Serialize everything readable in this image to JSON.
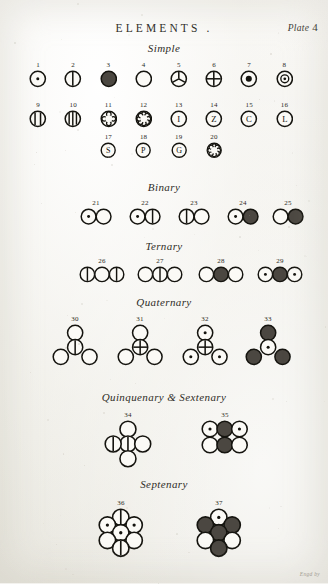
{
  "header": {
    "title": "ELEMENTS .",
    "plate_label": "Plate",
    "plate_number": "4"
  },
  "sections": [
    {
      "name": "simple",
      "heading": "Simple"
    },
    {
      "name": "binary",
      "heading": "Binary"
    },
    {
      "name": "ternary",
      "heading": "Ternary"
    },
    {
      "name": "quaternary",
      "heading": "Quaternary"
    },
    {
      "name": "quinquenary",
      "heading": "Quinquenary & Sextenary"
    },
    {
      "name": "septenary",
      "heading": "Septenary"
    }
  ],
  "signature": "Engd by",
  "colors": {
    "ink": "#15140f",
    "paper": "#f3f2ee",
    "fill_dark": "#4b4741",
    "fill_white": "#fbfaf6"
  },
  "figures": [
    {
      "n": "1",
      "section": "simple",
      "atoms": [
        {
          "glyph": "dot"
        }
      ]
    },
    {
      "n": "2",
      "section": "simple",
      "atoms": [
        {
          "glyph": "vline1"
        }
      ]
    },
    {
      "n": "3",
      "section": "simple",
      "atoms": [
        {
          "glyph": "solid"
        }
      ]
    },
    {
      "n": "4",
      "section": "simple",
      "atoms": [
        {
          "glyph": "empty"
        }
      ]
    },
    {
      "n": "5",
      "section": "simple",
      "atoms": [
        {
          "glyph": "ypart"
        }
      ]
    },
    {
      "n": "6",
      "section": "simple",
      "atoms": [
        {
          "glyph": "cross"
        }
      ]
    },
    {
      "n": "7",
      "section": "simple",
      "atoms": [
        {
          "glyph": "bigdot"
        }
      ]
    },
    {
      "n": "8",
      "section": "simple",
      "atoms": [
        {
          "glyph": "ring"
        }
      ]
    },
    {
      "n": "9",
      "section": "simple",
      "atoms": [
        {
          "glyph": "vline2"
        }
      ]
    },
    {
      "n": "10",
      "section": "simple",
      "atoms": [
        {
          "glyph": "vline3"
        }
      ]
    },
    {
      "n": "11",
      "section": "simple",
      "atoms": [
        {
          "glyph": "petal4"
        }
      ]
    },
    {
      "n": "12",
      "section": "simple",
      "atoms": [
        {
          "glyph": "petal8"
        }
      ]
    },
    {
      "n": "13",
      "section": "simple",
      "atoms": [
        {
          "glyph": "letter",
          "letter": "I"
        }
      ]
    },
    {
      "n": "14",
      "section": "simple",
      "atoms": [
        {
          "glyph": "letter",
          "letter": "Z"
        }
      ]
    },
    {
      "n": "15",
      "section": "simple",
      "atoms": [
        {
          "glyph": "letter",
          "letter": "C"
        }
      ]
    },
    {
      "n": "16",
      "section": "simple",
      "atoms": [
        {
          "glyph": "letter",
          "letter": "L"
        }
      ]
    },
    {
      "n": "17",
      "section": "simple",
      "atoms": [
        {
          "glyph": "letter",
          "letter": "S"
        }
      ]
    },
    {
      "n": "18",
      "section": "simple",
      "atoms": [
        {
          "glyph": "letter",
          "letter": "P"
        }
      ]
    },
    {
      "n": "19",
      "section": "simple",
      "atoms": [
        {
          "glyph": "letter",
          "letter": "G"
        }
      ]
    },
    {
      "n": "20",
      "section": "simple",
      "atoms": [
        {
          "glyph": "petal8b"
        }
      ]
    },
    {
      "n": "21",
      "section": "binary",
      "atoms": [
        {
          "glyph": "dot"
        },
        {
          "glyph": "empty"
        }
      ]
    },
    {
      "n": "22",
      "section": "binary",
      "atoms": [
        {
          "glyph": "dot"
        },
        {
          "glyph": "vline1"
        }
      ]
    },
    {
      "n": "23",
      "section": "binary",
      "atoms": [
        {
          "glyph": "vline1"
        },
        {
          "glyph": "empty"
        }
      ]
    },
    {
      "n": "24",
      "section": "binary",
      "atoms": [
        {
          "glyph": "dot"
        },
        {
          "glyph": "solid"
        }
      ]
    },
    {
      "n": "25",
      "section": "binary",
      "atoms": [
        {
          "glyph": "empty"
        },
        {
          "glyph": "solid"
        }
      ]
    },
    {
      "n": "26",
      "section": "ternary",
      "atoms": [
        {
          "glyph": "vline1"
        },
        {
          "glyph": "empty"
        },
        {
          "glyph": "vline1"
        }
      ]
    },
    {
      "n": "27",
      "section": "ternary",
      "atoms": [
        {
          "glyph": "empty"
        },
        {
          "glyph": "vline1"
        },
        {
          "glyph": "empty"
        }
      ]
    },
    {
      "n": "28",
      "section": "ternary",
      "atoms": [
        {
          "glyph": "empty"
        },
        {
          "glyph": "solid"
        },
        {
          "glyph": "empty"
        }
      ]
    },
    {
      "n": "29",
      "section": "ternary",
      "atoms": [
        {
          "glyph": "dot"
        },
        {
          "glyph": "solid"
        },
        {
          "glyph": "dot"
        }
      ]
    },
    {
      "n": "30",
      "section": "quaternary",
      "layout": "tri4",
      "atoms": [
        {
          "glyph": "empty"
        },
        {
          "glyph": "vline1"
        },
        {
          "glyph": "empty"
        },
        {
          "glyph": "empty"
        }
      ]
    },
    {
      "n": "31",
      "section": "quaternary",
      "layout": "tri4",
      "atoms": [
        {
          "glyph": "empty"
        },
        {
          "glyph": "cross"
        },
        {
          "glyph": "empty"
        },
        {
          "glyph": "empty"
        }
      ]
    },
    {
      "n": "32",
      "section": "quaternary",
      "layout": "tri4",
      "atoms": [
        {
          "glyph": "dot"
        },
        {
          "glyph": "cross"
        },
        {
          "glyph": "dot"
        },
        {
          "glyph": "dot"
        }
      ]
    },
    {
      "n": "33",
      "section": "quaternary",
      "layout": "tri4",
      "atoms": [
        {
          "glyph": "solid"
        },
        {
          "glyph": "dot"
        },
        {
          "glyph": "solid"
        },
        {
          "glyph": "solid"
        }
      ]
    },
    {
      "n": "34",
      "section": "quinquenary",
      "layout": "cross5",
      "atoms": [
        {
          "glyph": "empty"
        },
        {
          "glyph": "vline1"
        },
        {
          "glyph": "vline1"
        },
        {
          "glyph": "empty"
        },
        {
          "glyph": "empty"
        }
      ]
    },
    {
      "n": "35",
      "section": "quinquenary",
      "layout": "grid6",
      "atoms": [
        {
          "glyph": "dot"
        },
        {
          "glyph": "solid"
        },
        {
          "glyph": "dot"
        },
        {
          "glyph": "empty"
        },
        {
          "glyph": "solid"
        },
        {
          "glyph": "empty"
        }
      ]
    },
    {
      "n": "36",
      "section": "septenary",
      "layout": "hex7",
      "atoms": [
        {
          "glyph": "vline1"
        },
        {
          "glyph": "dot"
        },
        {
          "glyph": "dot"
        },
        {
          "glyph": "dot"
        },
        {
          "glyph": "empty"
        },
        {
          "glyph": "empty"
        },
        {
          "glyph": "vline1"
        }
      ]
    },
    {
      "n": "37",
      "section": "septenary",
      "layout": "hex7",
      "atoms": [
        {
          "glyph": "dot"
        },
        {
          "glyph": "solid"
        },
        {
          "glyph": "solid"
        },
        {
          "glyph": "solid"
        },
        {
          "glyph": "empty"
        },
        {
          "glyph": "empty"
        },
        {
          "glyph": "solid"
        }
      ]
    }
  ],
  "layout": {
    "row_simple_1_y": 62,
    "row_simple_2_y": 102,
    "row_simple_3_y": 134,
    "binary_head_y": 181,
    "binary_y": 200,
    "ternary_head_y": 240,
    "ternary_y": 258,
    "quaternary_head_y": 296,
    "quaternary_y": 316,
    "quinq_head_y": 391,
    "quinq_y": 412,
    "septenary_head_y": 478,
    "septenary_y": 500
  }
}
